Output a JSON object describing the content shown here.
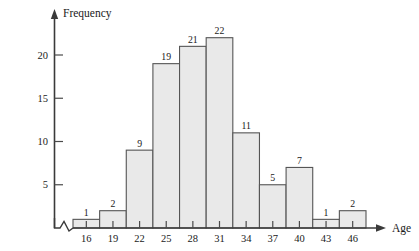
{
  "chart_data": {
    "type": "bar",
    "title": "",
    "subtitle": "",
    "xlabel": "Age",
    "ylabel": "Frequency",
    "categories": [
      "16",
      "19",
      "22",
      "25",
      "28",
      "31",
      "34",
      "37",
      "40",
      "43",
      "46"
    ],
    "values": [
      1,
      2,
      9,
      19,
      21,
      22,
      11,
      5,
      7,
      1,
      2
    ],
    "data_labels": [
      "1",
      "2",
      "9",
      "19",
      "21",
      "22",
      "11",
      "5",
      "7",
      "1",
      "2"
    ],
    "x_tick_labels": [
      "16",
      "19",
      "22",
      "25",
      "28",
      "31",
      "34",
      "37",
      "40",
      "43",
      "46"
    ],
    "y_tick_labels": [
      "5",
      "10",
      "15",
      "20"
    ],
    "y_tick_values": [
      5,
      10,
      15,
      20
    ],
    "ylim": [
      0,
      24
    ],
    "xlim": [
      14.5,
      47.5
    ],
    "bar_width": 3,
    "grid": false,
    "legend": null,
    "legend_position": "none",
    "axis_break": true,
    "annotations": [],
    "colors": {
      "bar_fill": "#e9e9e9",
      "bar_stroke": "#555555",
      "axis": "#3a3a3a",
      "text": "#1a1a1a"
    }
  },
  "axes": {
    "y_axis_title": "Frequency",
    "x_axis_title": "Age"
  },
  "icons": {
    "y_axis_arrow": "arrow-up-icon",
    "x_axis_arrow": "arrow-right-icon",
    "axis_break": "axis-break-zigzag-icon"
  }
}
